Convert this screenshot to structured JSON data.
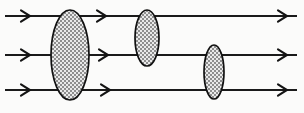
{
  "figure": {
    "width": 304,
    "height": 113,
    "background_color": "#fbfbfa",
    "line_color": "#1a1a1a",
    "ellipse_stroke_color": "#111111",
    "ellipse_fill_color": "#b9b9b9",
    "ellipse_fill_style": "stippled-checker"
  },
  "rays": [
    {
      "id": "ray-top",
      "label": "Top ray",
      "y": 16,
      "x_start": 5,
      "x_end": 297,
      "stroke_width": 2.0,
      "arrowheads": [
        {
          "name": "arrowhead-top-left",
          "x": 30,
          "y": 16,
          "size": 9
        },
        {
          "name": "arrowhead-top-middle",
          "x": 106,
          "y": 16,
          "size": 9
        },
        {
          "name": "arrowhead-top-right",
          "x": 287,
          "y": 16,
          "size": 9
        }
      ]
    },
    {
      "id": "ray-middle",
      "label": "Middle ray",
      "y": 55,
      "x_start": 5,
      "x_end": 297,
      "stroke_width": 2.0,
      "arrowheads": [
        {
          "name": "arrowhead-middle-left",
          "x": 30,
          "y": 55,
          "size": 9
        },
        {
          "name": "arrowhead-middle-middle",
          "x": 108,
          "y": 55,
          "size": 9
        },
        {
          "name": "arrowhead-middle-right",
          "x": 287,
          "y": 55,
          "size": 9
        }
      ]
    },
    {
      "id": "ray-bottom",
      "label": "Bottom ray",
      "y": 90,
      "x_start": 5,
      "x_end": 297,
      "stroke_width": 2.0,
      "arrowheads": [
        {
          "name": "arrowhead-bottom-left",
          "x": 30,
          "y": 90,
          "size": 9
        },
        {
          "name": "arrowhead-bottom-middle",
          "x": 110,
          "y": 90,
          "size": 9
        },
        {
          "name": "arrowhead-bottom-right",
          "x": 287,
          "y": 90,
          "size": 9
        }
      ]
    }
  ],
  "ellipses": [
    {
      "id": "ellipse-large",
      "label": "Large ellipse",
      "cx": 70,
      "cy": 55,
      "rx": 19,
      "ry": 45,
      "stroke_width": 1.9
    },
    {
      "id": "ellipse-medium",
      "label": "Medium ellipse",
      "cx": 147,
      "cy": 38,
      "rx": 12,
      "ry": 28,
      "stroke_width": 1.8
    },
    {
      "id": "ellipse-small",
      "label": "Small ellipse",
      "cx": 214,
      "cy": 72,
      "rx": 10,
      "ry": 27,
      "stroke_width": 1.8
    }
  ]
}
